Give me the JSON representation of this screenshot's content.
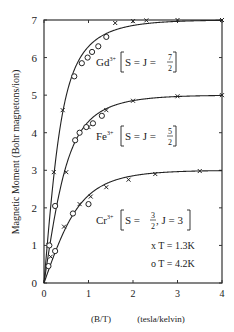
{
  "chart_data": {
    "type": "line",
    "title": "",
    "xlabel": "(B/T)    (tesla/kelvin)",
    "xlabel_parts": [
      "(B/T)",
      "(tesla/kelvin)"
    ],
    "ylabel": "Magnetic Moment (Bohr magnetons/ion)",
    "xlim": [
      0,
      4
    ],
    "ylim": [
      0,
      7
    ],
    "xticks": [
      "0",
      "1",
      "2",
      "3",
      "4"
    ],
    "yticks": [
      "0",
      "1",
      "2",
      "3",
      "4",
      "5",
      "6",
      "7"
    ],
    "grid": false,
    "legend": [
      {
        "marker": "x",
        "label": "T = 1.3K"
      },
      {
        "marker": "o",
        "label": "T = 4.2K"
      }
    ],
    "series": [
      {
        "name": "Gd3+ [S = J = 7/2]",
        "ion": "Gd",
        "charge": "3+",
        "spec": "S = J = ",
        "frac_num": "7",
        "frac_den": "2",
        "saturation": 7.0,
        "x_points_1_3K": [
          0.22,
          0.42,
          1.6,
          2.0,
          2.3,
          3.0,
          4.0
        ],
        "y_points_1_3K": [
          2.95,
          4.6,
          6.92,
          6.97,
          6.99,
          7.0,
          7.0
        ],
        "x_points_4_2K": [
          0.68,
          0.85,
          0.98,
          1.08,
          1.22,
          1.4
        ],
        "y_points_4_2K": [
          5.5,
          5.85,
          6.0,
          6.15,
          6.3,
          6.55
        ]
      },
      {
        "name": "Fe3+ [S = J = 5/2]",
        "ion": "Fe",
        "charge": "3+",
        "spec": "S = J = ",
        "frac_num": "5",
        "frac_den": "2",
        "saturation": 5.0,
        "x_points_1_3K": [
          0.1,
          0.5,
          1.0,
          1.4,
          2.0,
          3.0,
          4.0
        ],
        "y_points_1_3K": [
          1.0,
          2.95,
          4.15,
          4.6,
          4.85,
          4.97,
          5.0
        ],
        "x_points_4_2K": [
          0.12,
          0.25,
          0.7,
          0.8,
          0.95,
          1.1,
          1.3
        ],
        "y_points_4_2K": [
          1.0,
          2.05,
          3.8,
          4.0,
          4.15,
          4.25,
          4.45
        ]
      },
      {
        "name": "Cr3+ [S = 3/2, J = 3]",
        "ion": "Cr",
        "charge": "3+",
        "spec": "S = ",
        "frac_num": "3",
        "frac_den": "2",
        "spec_tail": ", J = 3",
        "saturation": 3.0,
        "x_points_1_3K": [
          0.15,
          0.45,
          0.8,
          1.05,
          1.4,
          1.9,
          2.5,
          3.5
        ],
        "y_points_1_3K": [
          0.7,
          1.5,
          2.1,
          2.3,
          2.55,
          2.75,
          2.9,
          2.98
        ],
        "x_points_4_2K": [
          0.1,
          0.25,
          0.65,
          1.0
        ],
        "y_points_4_2K": [
          0.45,
          0.85,
          1.85,
          2.1
        ]
      }
    ]
  }
}
